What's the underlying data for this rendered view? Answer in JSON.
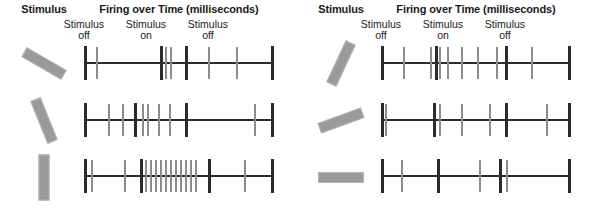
{
  "figure": {
    "background_color": "#ffffff",
    "bar_color": "#9a9a9a",
    "marker_color": "#2b2b2b",
    "spike_color": "#8c8c8c"
  },
  "panels": [
    {
      "id": "left-panel",
      "headers": {
        "stimulus": "Stimulus",
        "firing": "Firing over Time (milliseconds)"
      },
      "state_labels": [
        {
          "line1": "Stimulus",
          "line2": "off"
        },
        {
          "line1": "Stimulus",
          "line2": "on"
        },
        {
          "line1": "Stimulus",
          "line2": "off"
        }
      ],
      "rows": [
        {
          "id": "left-row-1",
          "stimulus_orientation_deg": 30,
          "stimulus_description": "bar tilted 30 degrees down to the right",
          "spikes": [
            12,
            81,
            86,
            124,
            152
          ],
          "markers": [
            0,
            76,
            101,
            187
          ]
        },
        {
          "id": "left-row-2",
          "stimulus_orientation_deg": 68,
          "stimulus_description": "bar tilted 68 degrees down to the right",
          "spikes": [
            24,
            38,
            58,
            63,
            74,
            85,
            170
          ],
          "markers": [
            0,
            50,
            101,
            187
          ]
        },
        {
          "id": "left-row-3",
          "stimulus_orientation_deg": 90,
          "stimulus_description": "vertical bar",
          "spikes": [
            7,
            40,
            61,
            66,
            71,
            76,
            81,
            86,
            91,
            96,
            101,
            106,
            111,
            160
          ],
          "markers": [
            0,
            56,
            124,
            187
          ]
        }
      ]
    },
    {
      "id": "right-panel",
      "headers": {
        "stimulus": "Stimulus",
        "firing": "Firing over Time (milliseconds)"
      },
      "state_labels": [
        {
          "line1": "Stimulus",
          "line2": "off"
        },
        {
          "line1": "Stimulus",
          "line2": "on"
        },
        {
          "line1": "Stimulus",
          "line2": "off"
        }
      ],
      "rows": [
        {
          "id": "right-row-1",
          "stimulus_orientation_deg": -65,
          "stimulus_description": "bar tilted 65 degrees up to the right",
          "spikes": [
            22,
            49,
            58,
            66,
            80,
            96,
            115,
            150
          ],
          "markers": [
            0,
            54,
            124,
            187
          ]
        },
        {
          "id": "right-row-2",
          "stimulus_orientation_deg": -20,
          "stimulus_description": "bar tilted 20 degrees up to the right",
          "spikes": [
            4,
            58,
            80,
            108,
            165
          ],
          "markers": [
            0,
            52,
            124,
            187
          ]
        },
        {
          "id": "right-row-3",
          "stimulus_orientation_deg": 0,
          "stimulus_description": "horizontal bar",
          "spikes": [
            20,
            98,
            125
          ],
          "markers": [
            0,
            56,
            118,
            187
          ]
        }
      ]
    }
  ]
}
